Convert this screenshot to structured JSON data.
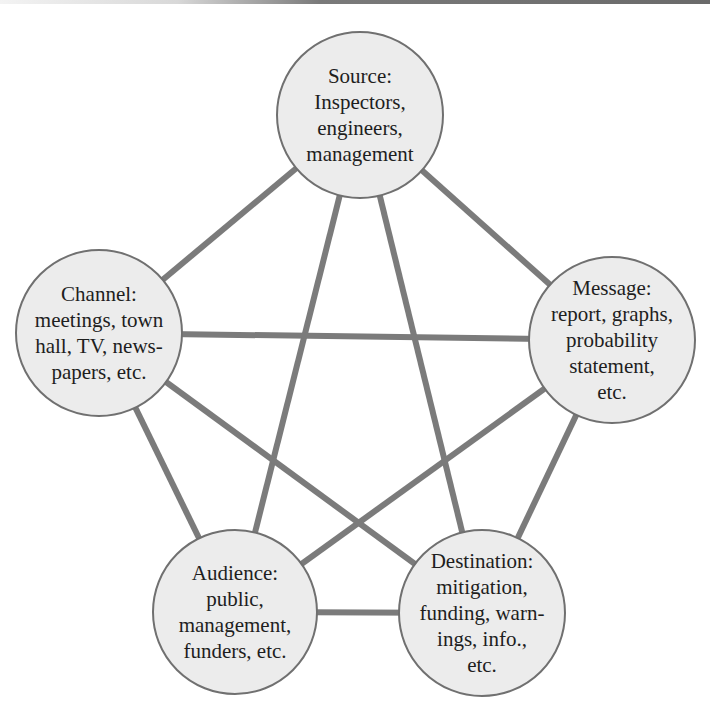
{
  "diagram": {
    "type": "complete-graph",
    "colors": {
      "edge": "#7b7b7b",
      "node_fill": "#ececec",
      "node_stroke": "#707070",
      "text": "#1e1e1e"
    },
    "nodes": [
      {
        "id": "source",
        "title": "Source:",
        "lines": [
          "Source:",
          "Inspectors,",
          "engineers,",
          "management"
        ]
      },
      {
        "id": "message",
        "title": "Message:",
        "lines": [
          "Message:",
          "report, graphs,",
          "probability",
          "statement,",
          "etc."
        ]
      },
      {
        "id": "destination",
        "title": "Destination:",
        "lines": [
          "Destination:",
          "mitigation,",
          "funding, warn-",
          "ings, info.,",
          "etc."
        ]
      },
      {
        "id": "audience",
        "title": "Audience:",
        "lines": [
          "Audience:",
          "public,",
          "management,",
          "funders, etc."
        ]
      },
      {
        "id": "channel",
        "title": "Channel:",
        "lines": [
          "Channel:",
          "meetings, town",
          "hall, TV, news-",
          "papers, etc."
        ]
      }
    ],
    "edges": [
      [
        "source",
        "message"
      ],
      [
        "source",
        "destination"
      ],
      [
        "source",
        "audience"
      ],
      [
        "source",
        "channel"
      ],
      [
        "message",
        "destination"
      ],
      [
        "message",
        "audience"
      ],
      [
        "message",
        "channel"
      ],
      [
        "destination",
        "audience"
      ],
      [
        "destination",
        "channel"
      ],
      [
        "audience",
        "channel"
      ]
    ]
  }
}
